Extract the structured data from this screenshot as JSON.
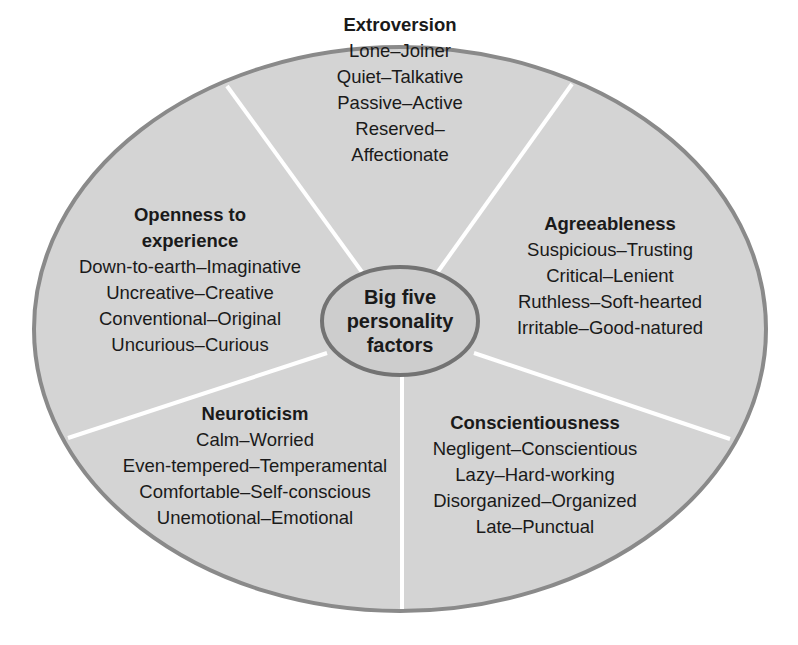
{
  "diagram": {
    "type": "segmented-ellipse",
    "center": {
      "label_lines": [
        "Big five",
        "personality",
        "factors"
      ]
    },
    "colors": {
      "fill": "#d4d4d4",
      "outline": "#8a8a8a",
      "center_fill": "#cdcdcd",
      "center_outline": "#737373",
      "divider": "#ffffff",
      "text": "#1a1a1a"
    },
    "segments": [
      {
        "title": "Extroversion",
        "traits": [
          "Lone–Joiner",
          "Quiet–Talkative",
          "Passive–Active",
          "Reserved–",
          "Affectionate"
        ]
      },
      {
        "title_lines": [
          "Openness to",
          "experience"
        ],
        "traits": [
          "Down-to-earth–Imaginative",
          "Uncreative–Creative",
          "Conventional–Original",
          "Uncurious–Curious"
        ]
      },
      {
        "title": "Agreeableness",
        "traits": [
          "Suspicious–Trusting",
          "Critical–Lenient",
          "Ruthless–Soft-hearted",
          "Irritable–Good-natured"
        ]
      },
      {
        "title": "Neuroticism",
        "traits": [
          "Calm–Worried",
          "Even-tempered–Temperamental",
          "Comfortable–Self-conscious",
          "Unemotional–Emotional"
        ]
      },
      {
        "title": "Conscientiousness",
        "traits": [
          "Negligent–Conscientious",
          "Lazy–Hard-working",
          "Disorganized–Organized",
          "Late–Punctual"
        ]
      }
    ]
  }
}
